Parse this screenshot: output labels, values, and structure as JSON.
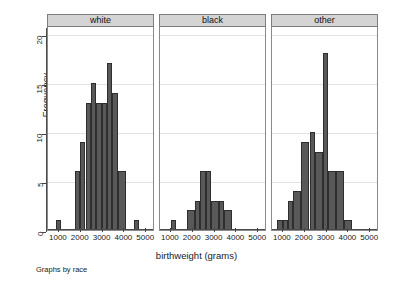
{
  "axes": {
    "ylabel": "Frequency",
    "yticks": [
      0,
      5,
      10,
      15,
      20
    ],
    "ylim": [
      0,
      20.8
    ],
    "xlabel": "birthweight (grams)",
    "xticks": [
      1000,
      2000,
      3000,
      4000,
      5000
    ],
    "xlim": [
      500,
      5400
    ]
  },
  "note": "Graphs by race",
  "panels": [
    {
      "title": "white"
    },
    {
      "title": "black"
    },
    {
      "title": "other"
    }
  ],
  "chart_data": {
    "type": "bar",
    "title": "",
    "subtitle": "",
    "xlabel": "birthweight (grams)",
    "ylabel": "Frequency",
    "xlim": [
      500,
      5400
    ],
    "ylim": [
      0,
      20.8
    ],
    "xticks": [
      1000,
      2000,
      3000,
      4000,
      5000
    ],
    "yticks": [
      0,
      5,
      10,
      15,
      20
    ],
    "grid": true,
    "legend": "none",
    "facet_by": "race",
    "facet_note": "Graphs by race",
    "bin_width": 250,
    "panels": [
      {
        "name": "white",
        "bins": [
          {
            "x_start": 875,
            "x_end": 1125,
            "value": 1
          },
          {
            "x_start": 1750,
            "x_end": 2000,
            "value": 6
          },
          {
            "x_start": 2000,
            "x_end": 2250,
            "value": 9
          },
          {
            "x_start": 2250,
            "x_end": 2500,
            "value": 13
          },
          {
            "x_start": 2500,
            "x_end": 2750,
            "value": 15
          },
          {
            "x_start": 2750,
            "x_end": 3000,
            "value": 13
          },
          {
            "x_start": 3000,
            "x_end": 3250,
            "value": 13
          },
          {
            "x_start": 3250,
            "x_end": 3500,
            "value": 17
          },
          {
            "x_start": 3500,
            "x_end": 3750,
            "value": 14
          },
          {
            "x_start": 3750,
            "x_end": 4125,
            "value": 6
          },
          {
            "x_start": 4500,
            "x_end": 4750,
            "value": 1
          }
        ]
      },
      {
        "name": "black",
        "bins": [
          {
            "x_start": 1000,
            "x_end": 1250,
            "value": 1
          },
          {
            "x_start": 1750,
            "x_end": 2125,
            "value": 2
          },
          {
            "x_start": 2125,
            "x_end": 2375,
            "value": 3
          },
          {
            "x_start": 2375,
            "x_end": 2625,
            "value": 6
          },
          {
            "x_start": 2625,
            "x_end": 2875,
            "value": 6
          },
          {
            "x_start": 2875,
            "x_end": 3250,
            "value": 3
          },
          {
            "x_start": 3250,
            "x_end": 3500,
            "value": 3
          },
          {
            "x_start": 3500,
            "x_end": 3875,
            "value": 2
          }
        ]
      },
      {
        "name": "other",
        "bins": [
          {
            "x_start": 750,
            "x_end": 1000,
            "value": 1
          },
          {
            "x_start": 1000,
            "x_end": 1250,
            "value": 1
          },
          {
            "x_start": 1250,
            "x_end": 1500,
            "value": 3
          },
          {
            "x_start": 1500,
            "x_end": 1875,
            "value": 4
          },
          {
            "x_start": 1875,
            "x_end": 2250,
            "value": 9
          },
          {
            "x_start": 2250,
            "x_end": 2500,
            "value": 10
          },
          {
            "x_start": 2500,
            "x_end": 2875,
            "value": 8
          },
          {
            "x_start": 2875,
            "x_end": 3125,
            "value": 18
          },
          {
            "x_start": 3125,
            "x_end": 3500,
            "value": 6
          },
          {
            "x_start": 3500,
            "x_end": 3875,
            "value": 6
          },
          {
            "x_start": 3875,
            "x_end": 4250,
            "value": 1
          }
        ]
      }
    ]
  }
}
